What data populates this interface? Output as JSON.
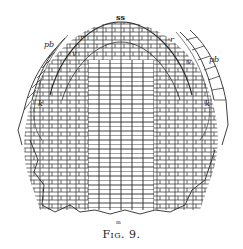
{
  "figure": {
    "caption": "Fig. 9.",
    "labels": {
      "apex": "ss",
      "r_left": "r",
      "r_right": "r",
      "v_left": "v",
      "v_right": "v",
      "pb_left": "pb",
      "pb_right": "pb",
      "k_left": "k",
      "k_right": "k",
      "bottom": "m"
    }
  },
  "colors": {
    "ink": "#2a2a2a",
    "background": "#ffffff"
  }
}
